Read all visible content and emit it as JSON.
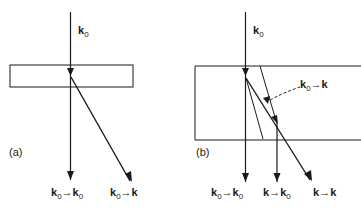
{
  "panels": [
    {
      "id": "a",
      "label": "(a)",
      "incident_label": "k",
      "incident_sub": "0",
      "beams": [
        {
          "label": "k",
          "sub": "0",
          "arrow": "→",
          "to": "k",
          "to_sub": "0"
        },
        {
          "label": "k",
          "sub": "0",
          "arrow": "→",
          "to": "k",
          "to_sub": ""
        }
      ]
    },
    {
      "id": "b",
      "label": "(b)",
      "incident_label": "k",
      "incident_sub": "0",
      "internal_annotation": {
        "label": "k",
        "sub": "0",
        "arrow": "→",
        "to": "k"
      },
      "beams": [
        {
          "label": "k",
          "sub": "0",
          "arrow": "→",
          "to": "k",
          "to_sub": "0"
        },
        {
          "label": "k",
          "sub": "",
          "arrow": "→",
          "to": "k",
          "to_sub": "0"
        },
        {
          "label": "k",
          "sub": "",
          "arrow": "→",
          "to": "k",
          "to_sub": ""
        }
      ]
    }
  ],
  "colors": {
    "line": "#1a1a1a",
    "background": "#ffffff"
  }
}
